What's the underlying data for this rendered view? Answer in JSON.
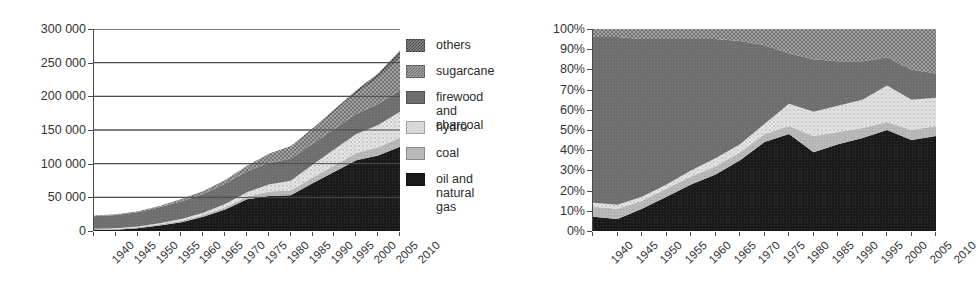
{
  "figure": {
    "series_names": [
      "oil and natural gas",
      "coal",
      "hydro",
      "firewood and charcoal",
      "sugarcane",
      "others"
    ],
    "colors": {
      "oil": "#1a1a1a",
      "coal": "#b4b4b4",
      "hydro": "#dcdcdc",
      "firewood": "#6e6e6e",
      "sugarcane": "#8c8c8c",
      "others": "#5a5a5a",
      "axis": "#4a4a4a",
      "grid": "#5a5a5a",
      "text": "#2b2b2b"
    }
  },
  "legend": {
    "items": [
      {
        "key": "others",
        "label": "others",
        "pattern": "checker-dark"
      },
      {
        "key": "sugarcane",
        "label": "sugarcane",
        "pattern": "checker-mid"
      },
      {
        "key": "firewood",
        "label": "firewood and\ncharcoal",
        "pattern": "solid-dark-gray"
      },
      {
        "key": "hydro",
        "label": "hydro",
        "pattern": "checker-light"
      },
      {
        "key": "coal",
        "label": "coal",
        "pattern": "solid-light-gray"
      },
      {
        "key": "oil",
        "label": "oil and natural gas",
        "pattern": "solid-black"
      }
    ]
  },
  "chart_data": [
    {
      "id": "absolute",
      "type": "area",
      "stacked": true,
      "title": "",
      "xlabel": "",
      "ylabel": "",
      "grid": true,
      "legend_position": "right",
      "x": [
        1940,
        1945,
        1950,
        1955,
        1960,
        1965,
        1970,
        1975,
        1980,
        1985,
        1990,
        1995,
        2000,
        2005,
        2010
      ],
      "xtick_labels": [
        "1940",
        "1945",
        "1950",
        "1955",
        "1960",
        "1965",
        "1970",
        "1975",
        "1980",
        "1985",
        "1990",
        "1995",
        "2000",
        "2005",
        "2010"
      ],
      "ylim": [
        0,
        300000
      ],
      "ytick_labels": [
        "0",
        "50 000",
        "100 000",
        "150 000",
        "200 000",
        "250 000",
        "300 000"
      ],
      "yticks": [
        0,
        50000,
        100000,
        150000,
        200000,
        250000,
        300000
      ],
      "series": [
        {
          "name": "oil and natural gas",
          "key": "oil",
          "values": [
            1500,
            2000,
            4000,
            8000,
            13000,
            21000,
            32000,
            47000,
            52000,
            53000,
            71000,
            88000,
            105000,
            112000,
            125000
          ]
        },
        {
          "name": "coal",
          "key": "coal",
          "values": [
            1400,
            1400,
            1700,
            2000,
            2400,
            2700,
            3200,
            4000,
            6500,
            7000,
            8500,
            9500,
            11000,
            12500,
            14000
          ]
        },
        {
          "name": "hydro",
          "key": "hydro",
          "values": [
            500,
            700,
            1100,
            1600,
            2400,
            3400,
            4800,
            6700,
            10500,
            14500,
            19000,
            24000,
            28000,
            33000,
            38000
          ]
        },
        {
          "name": "firewood and charcoal",
          "key": "firewood",
          "values": [
            18500,
            19500,
            21000,
            23500,
            26500,
            28000,
            30000,
            31000,
            32000,
            33000,
            31000,
            30500,
            30000,
            31000,
            32000
          ]
        },
        {
          "name": "sugarcane",
          "key": "sugarcane",
          "values": [
            1000,
            1200,
            1600,
            2200,
            3200,
            4200,
            5500,
            7500,
            12500,
            16500,
            20000,
            25000,
            30000,
            38000,
            48000
          ]
        },
        {
          "name": "others",
          "key": "others",
          "values": [
            0,
            0,
            0,
            0,
            0,
            200,
            400,
            700,
            1200,
            1800,
            2600,
            3500,
            5000,
            7500,
            11000
          ]
        }
      ]
    },
    {
      "id": "percentage",
      "type": "area",
      "stacked": true,
      "normalized": true,
      "title": "",
      "xlabel": "",
      "ylabel": "",
      "grid": false,
      "legend_position": "shared",
      "x": [
        1940,
        1945,
        1950,
        1955,
        1960,
        1965,
        1970,
        1975,
        1980,
        1985,
        1990,
        1995,
        2000,
        2005,
        2010
      ],
      "xtick_labels": [
        "1940",
        "1945",
        "1950",
        "1955",
        "1960",
        "1965",
        "1970",
        "1975",
        "1980",
        "1985",
        "1990",
        "1995",
        "2000",
        "2005",
        "2010"
      ],
      "ylim": [
        0,
        100
      ],
      "ytick_labels": [
        "0%",
        "10%",
        "20%",
        "30%",
        "40%",
        "50%",
        "60%",
        "70%",
        "80%",
        "90%",
        "100%"
      ],
      "yticks": [
        0,
        10,
        20,
        30,
        40,
        50,
        60,
        70,
        80,
        90,
        100
      ],
      "series": [
        {
          "name": "oil and natural gas",
          "key": "oil",
          "values": [
            7,
            6,
            11,
            17,
            23,
            28,
            35,
            44,
            48,
            39,
            43,
            46,
            50,
            45,
            47
          ]
        },
        {
          "name": "coal",
          "key": "coal",
          "values": [
            5,
            5,
            4,
            4,
            4,
            4,
            4,
            4,
            4,
            8,
            6,
            5,
            4,
            5,
            5
          ]
        },
        {
          "name": "hydro",
          "key": "hydro",
          "values": [
            2,
            2,
            2,
            2,
            3,
            4,
            4,
            5,
            11,
            12,
            13,
            14,
            18,
            15,
            14
          ]
        },
        {
          "name": "firewood and charcoal",
          "key": "firewood",
          "values": [
            82,
            83,
            78,
            72,
            65,
            59,
            51,
            39,
            25,
            26,
            22,
            19,
            14,
            15,
            12
          ]
        },
        {
          "name": "sugarcane",
          "key": "sugarcane",
          "values": [
            4,
            4,
            5,
            5,
            5,
            5,
            6,
            8,
            12,
            15,
            16,
            16,
            14,
            20,
            22
          ]
        },
        {
          "name": "others",
          "key": "others",
          "values": [
            0,
            0,
            0,
            0,
            0,
            0,
            0,
            0,
            0,
            0,
            0,
            0,
            0,
            0,
            0
          ]
        }
      ]
    }
  ]
}
